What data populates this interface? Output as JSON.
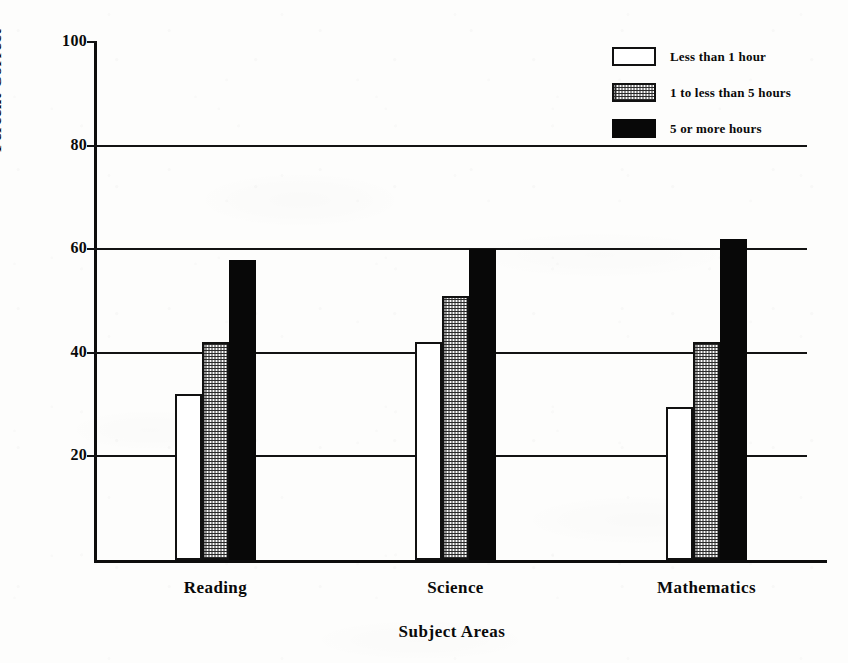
{
  "chart_data": {
    "type": "bar",
    "title": "",
    "xlabel": "Subject Areas",
    "ylabel": "Percent Correct",
    "categories": [
      "Reading",
      "Science",
      "Mathematics"
    ],
    "series": [
      {
        "name": "Less than 1 hour",
        "fill": "white",
        "values": [
          32,
          42,
          29.5
        ]
      },
      {
        "name": "1 to less than 5 hours",
        "fill": "dotted",
        "values": [
          42,
          51,
          42
        ]
      },
      {
        "name": "5 or more hours",
        "fill": "black",
        "values": [
          58,
          60,
          62
        ]
      }
    ],
    "ylim": [
      0,
      100
    ],
    "yticks": [
      20,
      40,
      60,
      80,
      100
    ],
    "ytick_labels": [
      "20",
      "40",
      "60",
      "80",
      "100"
    ],
    "grid": "horizontal",
    "legend_position": "top-right",
    "colors": {
      "ink": "#0d0d0d",
      "background": "#fdfdfc",
      "series_white": "#ffffff",
      "series_dotted": "#2a2a2a",
      "series_black": "#080808"
    }
  }
}
